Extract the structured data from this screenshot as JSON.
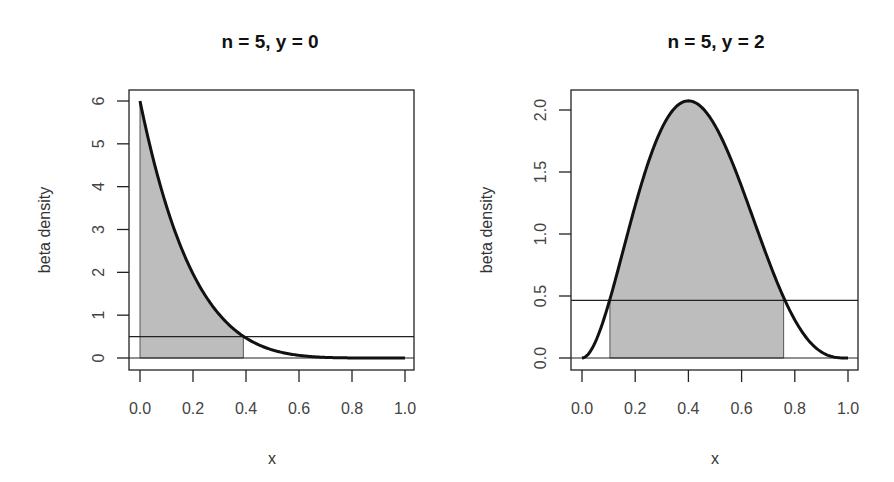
{
  "chart_data": [
    {
      "type": "area",
      "title": "n = 5, y = 0",
      "xlabel": "x",
      "ylabel": "beta density",
      "xlim": [
        0.0,
        1.0
      ],
      "ylim": [
        0,
        6
      ],
      "x_ticks": [
        "0.0",
        "0.2",
        "0.4",
        "0.6",
        "0.8",
        "1.0"
      ],
      "y_ticks": [
        "0",
        "1",
        "2",
        "3",
        "4",
        "5",
        "6"
      ],
      "grid": false,
      "series": [
        {
          "name": "Beta(1,6) density",
          "alpha": 1,
          "beta": 6,
          "x": [
            0.0,
            0.1,
            0.2,
            0.3,
            0.4,
            0.5,
            0.6,
            0.7,
            0.8,
            0.9,
            1.0
          ],
          "values": [
            6.0,
            3.54,
            1.97,
            1.01,
            0.47,
            0.19,
            0.06,
            0.01,
            0.0,
            0.0,
            0.0
          ]
        }
      ],
      "threshold_line": 0.5,
      "shaded_interval": [
        0.0,
        0.39
      ],
      "shade_color": "#bdbdbd",
      "curve_color": "#111111"
    },
    {
      "type": "area",
      "title": "n = 5, y = 2",
      "xlabel": "x",
      "ylabel": "beta density",
      "xlim": [
        0.0,
        1.0
      ],
      "ylim": [
        0.0,
        2.0
      ],
      "x_ticks": [
        "0.0",
        "0.2",
        "0.4",
        "0.6",
        "0.8",
        "1.0"
      ],
      "y_ticks": [
        "0.0",
        "0.5",
        "1.0",
        "1.5",
        "2.0"
      ],
      "grid": false,
      "series": [
        {
          "name": "Beta(3,4) density",
          "alpha": 3,
          "beta": 4,
          "x": [
            0.0,
            0.1,
            0.2,
            0.3,
            0.4,
            0.5,
            0.6,
            0.7,
            0.8,
            0.9,
            1.0
          ],
          "values": [
            0.0,
            0.44,
            1.23,
            1.85,
            2.07,
            1.88,
            1.38,
            0.79,
            0.31,
            0.05,
            0.0
          ]
        }
      ],
      "threshold_line": 0.465,
      "shaded_interval": [
        0.105,
        0.758
      ],
      "shade_color": "#bdbdbd",
      "curve_color": "#111111"
    }
  ]
}
